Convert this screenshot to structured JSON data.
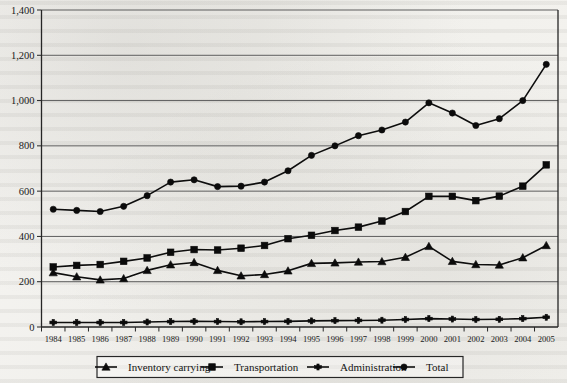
{
  "chart_data": {
    "type": "line",
    "title": "",
    "subtitle": "",
    "xlabel": "",
    "ylabel": "",
    "xlim": [
      1984,
      2005
    ],
    "ylim": [
      0,
      1400
    ],
    "ytick_step": 200,
    "grid": true,
    "legend_position": "bottom",
    "categories": [
      "1984",
      "1985",
      "1986",
      "1987",
      "1988",
      "1989",
      "1990",
      "1991",
      "1992",
      "1993",
      "1994",
      "1995",
      "1996",
      "1997",
      "1998",
      "1999",
      "2000",
      "2001",
      "2002",
      "2003",
      "2004",
      "2005"
    ],
    "ytick_labels": [
      "0",
      "200",
      "400",
      "600",
      "800",
      "1,000",
      "1,200",
      "1,400"
    ],
    "ytick_values": [
      0,
      200,
      400,
      600,
      800,
      1000,
      1200,
      1400
    ],
    "series": [
      {
        "name": "Inventory carrying",
        "marker": "triangle",
        "values": [
          240,
          222,
          208,
          214,
          250,
          275,
          285,
          250,
          226,
          232,
          248,
          281,
          283,
          287,
          289,
          308,
          356,
          290,
          276,
          274,
          306,
          360
        ]
      },
      {
        "name": "Transportation",
        "marker": "square",
        "values": [
          265,
          272,
          276,
          290,
          305,
          330,
          342,
          340,
          348,
          360,
          390,
          405,
          426,
          441,
          468,
          510,
          577,
          577,
          558,
          578,
          622,
          716
        ]
      },
      {
        "name": "Administration",
        "marker": "asterisk",
        "values": [
          20,
          20,
          20,
          20,
          22,
          24,
          25,
          24,
          23,
          24,
          25,
          27,
          28,
          29,
          30,
          33,
          37,
          35,
          33,
          34,
          37,
          43
        ]
      },
      {
        "name": "Total",
        "marker": "circle",
        "values": [
          520,
          515,
          510,
          533,
          580,
          640,
          650,
          620,
          622,
          640,
          690,
          758,
          800,
          845,
          870,
          905,
          990,
          945,
          890,
          920,
          1000,
          1160
        ]
      }
    ]
  },
  "legend": {
    "entries": [
      {
        "label": "Inventory carrying",
        "marker": "triangle"
      },
      {
        "label": "Transportation",
        "marker": "square"
      },
      {
        "label": "Administration",
        "marker": "asterisk"
      },
      {
        "label": "Total",
        "marker": "circle"
      }
    ]
  }
}
